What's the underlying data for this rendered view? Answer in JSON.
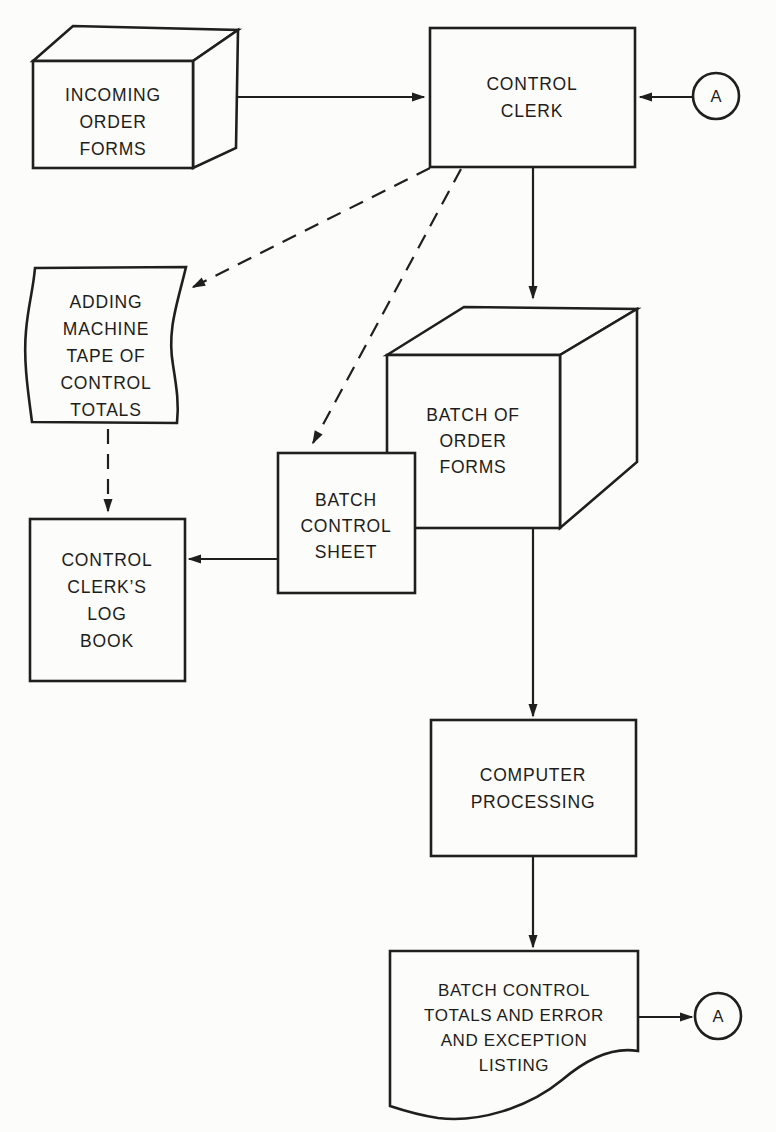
{
  "diagram": {
    "type": "flowchart",
    "ink_color": "#1f1f1f",
    "paper_color": "#fcfcfa",
    "connector_label": "A",
    "nodes": {
      "incoming_order_forms": {
        "shape": "3d-box",
        "lines": [
          "INCOMING",
          "ORDER",
          "FORMS"
        ]
      },
      "control_clerk": {
        "shape": "rectangle",
        "lines": [
          "CONTROL",
          "CLERK"
        ]
      },
      "connector_a_top": {
        "shape": "circle",
        "label": "A"
      },
      "adding_machine_tape": {
        "shape": "tape",
        "lines": [
          "ADDING",
          "MACHINE",
          "TAPE OF",
          "CONTROL",
          "TOTALS"
        ]
      },
      "batch_of_order_forms": {
        "shape": "3d-box",
        "lines": [
          "BATCH OF",
          "ORDER",
          "FORMS"
        ]
      },
      "batch_control_sheet": {
        "shape": "rectangle",
        "lines": [
          "BATCH",
          "CONTROL",
          "SHEET"
        ]
      },
      "control_clerks_log_book": {
        "shape": "rectangle",
        "lines": [
          "CONTROL",
          "CLERK’S",
          "LOG",
          "BOOK"
        ]
      },
      "computer_processing": {
        "shape": "rectangle",
        "lines": [
          "COMPUTER",
          "PROCESSING"
        ]
      },
      "batch_control_totals_listing": {
        "shape": "document",
        "lines": [
          "BATCH CONTROL",
          "TOTALS AND ERROR",
          "AND EXCEPTION",
          "LISTING"
        ]
      },
      "connector_a_bottom": {
        "shape": "circle",
        "label": "A"
      }
    },
    "edges": [
      {
        "from": "incoming_order_forms",
        "to": "control_clerk",
        "style": "solid"
      },
      {
        "from": "connector_a_top",
        "to": "control_clerk",
        "style": "solid"
      },
      {
        "from": "control_clerk",
        "to": "batch_of_order_forms",
        "style": "solid"
      },
      {
        "from": "control_clerk",
        "to": "adding_machine_tape",
        "style": "dashed"
      },
      {
        "from": "control_clerk",
        "to": "batch_control_sheet",
        "style": "dashed"
      },
      {
        "from": "adding_machine_tape",
        "to": "control_clerks_log_book",
        "style": "dashed"
      },
      {
        "from": "batch_control_sheet",
        "to": "control_clerks_log_book",
        "style": "solid"
      },
      {
        "from": "batch_of_order_forms",
        "to": "computer_processing",
        "style": "solid"
      },
      {
        "from": "computer_processing",
        "to": "batch_control_totals_listing",
        "style": "solid"
      },
      {
        "from": "batch_control_totals_listing",
        "to": "connector_a_bottom",
        "style": "solid"
      }
    ]
  }
}
